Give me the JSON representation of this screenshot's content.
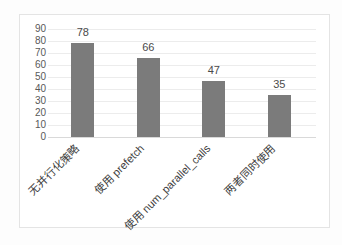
{
  "chart_data": {
    "type": "bar",
    "categories": [
      "无并行化策略",
      "使用 prefetch",
      "使用 num_parallel_calls",
      "两者同时使用"
    ],
    "values": [
      78,
      66,
      47,
      35
    ],
    "data_labels": [
      "78",
      "66",
      "47",
      "35"
    ],
    "title": "",
    "xlabel": "",
    "ylabel": "",
    "ylim": [
      0,
      90
    ],
    "ytick_step": 10,
    "ytick_labels": [
      "0",
      "10",
      "20",
      "30",
      "40",
      "50",
      "60",
      "70",
      "80",
      "90"
    ],
    "grid": true,
    "legend": "none",
    "category_label_rotation_deg": 45
  },
  "colors": {
    "bar": "#7b7b7b",
    "grid": "#ececec",
    "axis_line": "#d9d9d9",
    "tick_text": "#595959",
    "value_text": "#4a4a4a",
    "category_text": "#3d3d3d",
    "frame_border": "#e4e4e4",
    "background": "#ffffff"
  }
}
